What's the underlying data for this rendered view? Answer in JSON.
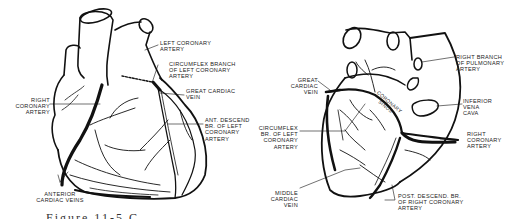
{
  "figure": {
    "caption": "Figure 11-5 C",
    "anterior_view": {
      "labels": [
        {
          "id": "left-coronary-artery",
          "text": "LEFT CORONARY\nARTERY"
        },
        {
          "id": "circumflex-branch",
          "text": "CIRCUMFLEX BRANCH\nOF LEFT CORONARY\nARTERY"
        },
        {
          "id": "right-coronary-artery",
          "text": "RIGHT\nCORONARY\nARTERY"
        },
        {
          "id": "great-cardiac-vein",
          "text": "GREAT CARDIAC\nVEIN"
        },
        {
          "id": "ant-descend-br",
          "text": "ANT. DESCEND\nBR. OF LEFT\nCORONARY\nARTERY"
        },
        {
          "id": "anterior-cardiac-veins",
          "text": "ANTERIOR\nCARDIAC VEINS"
        }
      ]
    },
    "posterior_view": {
      "labels": [
        {
          "id": "right-branch-pulmonary",
          "text": "RIGHT BRANCH\nOF PULMONARY\nARTERY"
        },
        {
          "id": "great-cardiac-vein",
          "text": "GREAT\nCARDIAC\nVEIN"
        },
        {
          "id": "coronary-sinus",
          "text": "CORONARY\nSINUS"
        },
        {
          "id": "inferior-vena-cava",
          "text": "INFERIOR\nVENA\nCAVA"
        },
        {
          "id": "circumflex-br",
          "text": "CIRCUMFLEX\nBR. OF LEFT\nCORONARY\nARTERY"
        },
        {
          "id": "right-coronary-artery",
          "text": "RIGHT\nCORONARY\nARTERY"
        },
        {
          "id": "middle-cardiac-vein",
          "text": "MIDDLE\nCARDIAC\nVEIN"
        },
        {
          "id": "post-descend-br",
          "text": "POST. DESCEND. BR.\nOF RIGHT CORONARY\nARTERY"
        }
      ]
    }
  }
}
